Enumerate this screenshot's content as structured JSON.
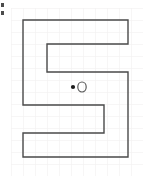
{
  "canvas": {
    "width": 145,
    "height": 178,
    "background_color": "#ffffff"
  },
  "grid": {
    "visible": true,
    "cell_size": 12,
    "origin_x": 11,
    "origin_y": 8,
    "columns": 11,
    "rows": 14,
    "line_color": "#f0eeee",
    "line_width": 1
  },
  "shape": {
    "name": "s-shaped-polygon",
    "stroke_color": "#4a4a4a",
    "stroke_width": 1.4,
    "fill": "none",
    "closed": true,
    "vertices": [
      {
        "x": 23,
        "y": 20
      },
      {
        "x": 128,
        "y": 20
      },
      {
        "x": 128,
        "y": 44
      },
      {
        "x": 47,
        "y": 44
      },
      {
        "x": 47,
        "y": 72
      },
      {
        "x": 128,
        "y": 72
      },
      {
        "x": 128,
        "y": 157
      },
      {
        "x": 23,
        "y": 157
      },
      {
        "x": 23,
        "y": 133
      },
      {
        "x": 104,
        "y": 133
      },
      {
        "x": 104,
        "y": 105
      },
      {
        "x": 23,
        "y": 105
      }
    ]
  },
  "markers": {
    "point": {
      "label": "query-point",
      "x": 73,
      "y": 87,
      "radius": 2.1,
      "fill_color": "#1a1a1a",
      "filled": true
    },
    "circle": {
      "label": "open-circle-marker",
      "x": 82,
      "y": 87,
      "radius_x": 4.2,
      "radius_y": 5.0,
      "stroke_color": "#5a5a5a",
      "stroke_width": 1.2,
      "fill": "none",
      "filled": false
    }
  },
  "artifact": {
    "name": "left-edge-clipped-glyph",
    "x": 1,
    "y": 3,
    "width": 3,
    "height": 14,
    "color": "#2b2b2b"
  }
}
